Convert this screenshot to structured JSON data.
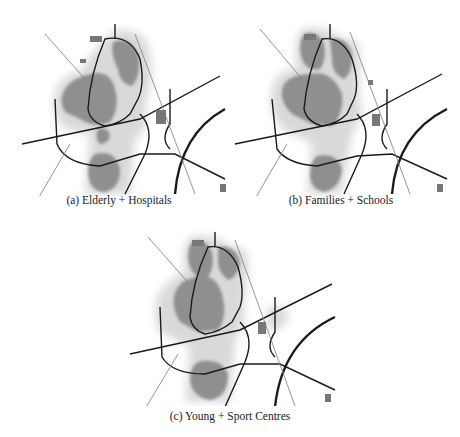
{
  "figure": {
    "panels": [
      {
        "id": "a",
        "caption": "(a) Elderly + Hospitals",
        "group": "Elderly",
        "facility": "Hospitals"
      },
      {
        "id": "b",
        "caption": "(b) Families + Schools",
        "group": "Families",
        "facility": "Schools"
      },
      {
        "id": "c",
        "caption": "(c) Young + Sport Centres",
        "group": "Young",
        "facility": "Sport Centres"
      }
    ],
    "colors": {
      "heat_core": "#8f8f8f",
      "heat_halo": "#d6d6d6",
      "road": "#1a1a1a",
      "rail": "#9a9a9a",
      "background": "#ffffff"
    }
  }
}
